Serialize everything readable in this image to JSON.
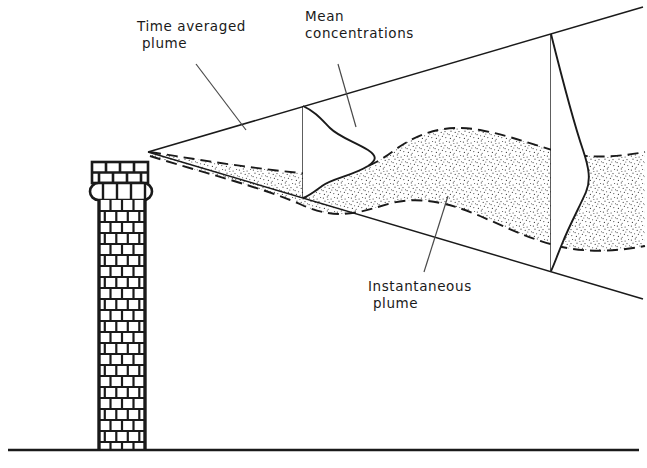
{
  "figure": {
    "type": "technical-diagram",
    "background_color": "#ffffff",
    "ink_color": "#1a1a1a",
    "stipple_color": "#4a4a4a"
  },
  "labels": {
    "time_averaged": "Time averaged\n plume",
    "mean_concentrations": "Mean\nconcentrations",
    "instantaneous": "Instantaneous\n plume"
  },
  "elements": {
    "ground_line": "ground-line",
    "stack": "brick-chimney-stack",
    "cone": "time-averaged-plume-cone",
    "meander": "instantaneous-plume-band",
    "profile_near": "gaussian-concentration-profile-near",
    "profile_far": "gaussian-concentration-profile-far"
  },
  "geometry": {
    "ground_y": 450,
    "stack_top_y": 162,
    "stack_shaft_left": 99,
    "stack_shaft_right": 145,
    "cone_apex": [
      148,
      152
    ],
    "cone_upper_end": [
      643,
      7
    ],
    "cone_lower_end": [
      643,
      299
    ],
    "profile_near_x": 303,
    "profile_far_x": 551
  }
}
